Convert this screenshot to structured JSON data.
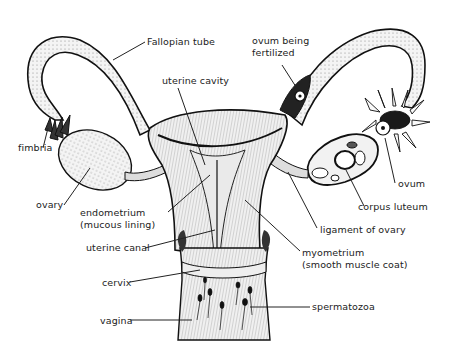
{
  "diagram": {
    "background": "#ffffff",
    "ink_color": "#1a1a1a",
    "labels": {
      "fallopian_tube": "Fallopian tube",
      "uterine_cavity": "uterine cavity",
      "ovum_being_fertilized_1": "ovum being",
      "ovum_being_fertilized_2": "fertilized",
      "fimbria": "fimbria",
      "ovary": "ovary",
      "endometrium_1": "endometrium",
      "endometrium_2": "(mucous lining)",
      "ovum": "ovum",
      "corpus_luteum": "corpus luteum",
      "ligament_of_ovary": "ligament of ovary",
      "uterine_canal": "uterine canal",
      "myometrium_1": "myometrium",
      "myometrium_2": "(smooth muscle coat)",
      "cervix": "cervix",
      "spermatozoa": "spermatozoa",
      "vagina": "vagina"
    }
  }
}
